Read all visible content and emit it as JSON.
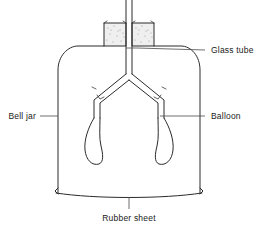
{
  "figure": {
    "labels": [
      {
        "id": "glass-tube",
        "text": "Glass tube"
      },
      {
        "id": "bell-jar",
        "text": "Bell jar"
      },
      {
        "id": "balloon",
        "text": "Balloon"
      },
      {
        "id": "rubber-sheet",
        "text": "Rubber sheet"
      }
    ],
    "parts": [
      {
        "id": "glass-tube",
        "name": "Glass tube"
      },
      {
        "id": "stopper",
        "name": "Stopper"
      },
      {
        "id": "bell-jar",
        "name": "Bell jar"
      },
      {
        "id": "bronchi",
        "name": "Branching tubes"
      },
      {
        "id": "balloon-left",
        "name": "Balloon"
      },
      {
        "id": "balloon-right",
        "name": "Balloon"
      },
      {
        "id": "rubber-sheet",
        "name": "Rubber sheet"
      }
    ],
    "colors": {
      "ink": "#2b2b2b",
      "leader": "#4a4a4a",
      "background": "#ffffff",
      "stopper": "#efefef"
    }
  }
}
